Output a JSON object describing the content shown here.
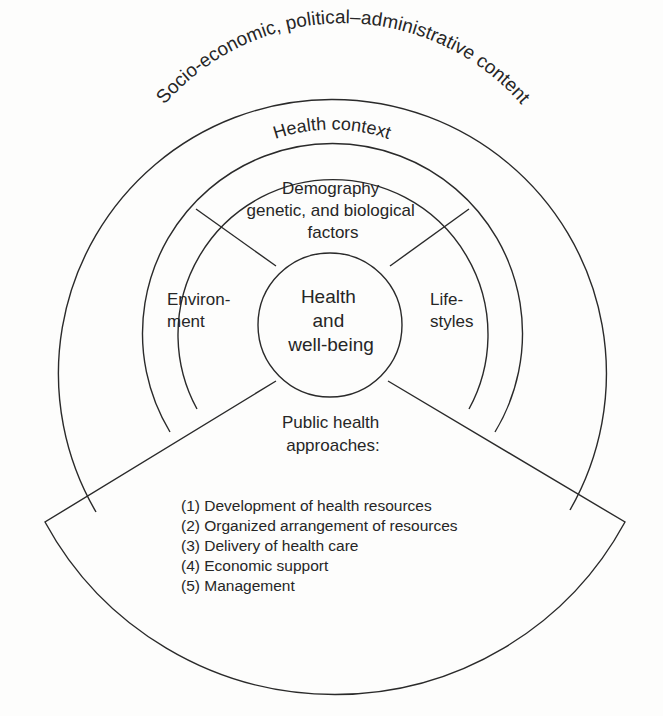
{
  "diagram": {
    "outer_ring": {
      "label": "Socio-economic, political–administrative content"
    },
    "context_ring": {
      "label": "Health context"
    },
    "segments": {
      "top": {
        "lines": [
          "Demography",
          "genetic, and biological",
          "factors"
        ]
      },
      "left": {
        "lines": [
          "Environ-",
          "ment"
        ]
      },
      "right": {
        "lines": [
          "Life-",
          "styles"
        ]
      }
    },
    "core": {
      "lines": [
        "Health",
        "and",
        "well-being"
      ]
    },
    "bottom_wedge": {
      "heading": [
        "Public health",
        "approaches:"
      ],
      "items": [
        "(1) Development of health resources",
        "(2) Organized arrangement of resources",
        "(3) Delivery of health care",
        "(4) Economic support",
        "(5) Management"
      ]
    }
  }
}
